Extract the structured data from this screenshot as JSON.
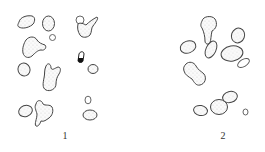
{
  "figure": {
    "panels": [
      {
        "label": "1"
      },
      {
        "label": "2"
      }
    ]
  }
}
